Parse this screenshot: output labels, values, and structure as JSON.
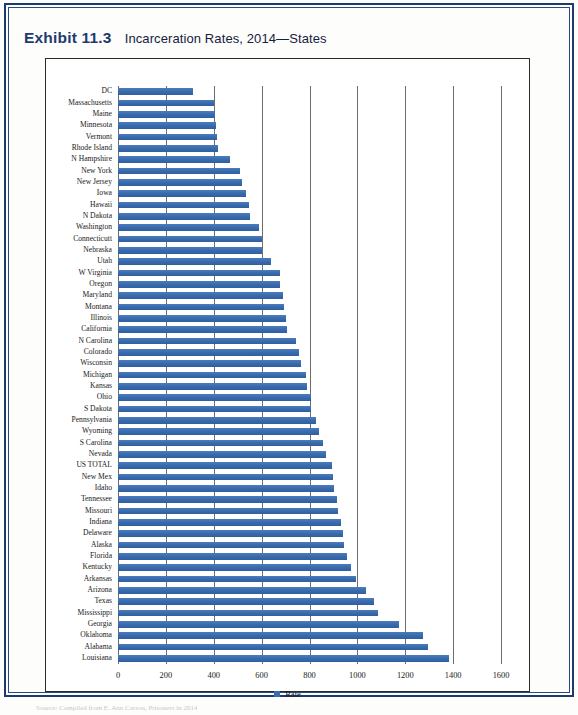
{
  "exhibit": {
    "label": "Exhibit 11.3",
    "title": "Incarceration Rates, 2014—States"
  },
  "source_note": "Source: Compiled from E. Ann Carson, Prisoners in 2014",
  "colors": {
    "bar_blue": "#3a6cae",
    "frame_navy": "#1d3a70",
    "gridline": "#6d6d6d",
    "plot_border": "#2b2b2b"
  },
  "chart_data": {
    "type": "bar",
    "orientation": "horizontal",
    "title": "Incarceration Rates, 2014—States",
    "xlabel": "",
    "ylabel": "",
    "xlim": [
      0,
      1600
    ],
    "xticks": [
      0,
      200,
      400,
      600,
      800,
      1000,
      1200,
      1400,
      1600
    ],
    "grid": true,
    "legend": {
      "position": "bottom",
      "entries": [
        "Rate"
      ]
    },
    "series_name": "Rate",
    "categories": [
      "DC",
      "Massachusetts",
      "Maine",
      "Minnesota",
      "Vermont",
      "Rhode Island",
      "N Hampshire",
      "New York",
      "New Jersey",
      "Iowa",
      "Hawaii",
      "N Dakota",
      "Washington",
      "Connecticutt",
      "Nebraska",
      "Utah",
      "W Virginia",
      "Oregon",
      "Maryland",
      "Montana",
      "Illinois",
      "California",
      "N Carolina",
      "Colorado",
      "Wisconsin",
      "Michigan",
      "Kansas",
      "Ohio",
      "S Dakota",
      "Pennsylvania",
      "Wyoming",
      "S Carolina",
      "Nevada",
      "US TOTAL",
      "New Mex",
      "Idaho",
      "Tennessee",
      "Missouri",
      "Indiana",
      "Delaware",
      "Alaska",
      "Florida",
      "Kentucky",
      "Arkansas",
      "Arizona",
      "Texas",
      "Mississippi",
      "Georgia",
      "Oklahoma",
      "Alabama",
      "Louisiana"
    ],
    "values": [
      312,
      403,
      406,
      411,
      412,
      419,
      469,
      511,
      517,
      534,
      547,
      553,
      589,
      600,
      603,
      639,
      676,
      677,
      689,
      693,
      700,
      707,
      742,
      758,
      766,
      784,
      789,
      805,
      807,
      829,
      838,
      856,
      871,
      893,
      898,
      904,
      913,
      920,
      932,
      938,
      943,
      955,
      974,
      995,
      1037,
      1068,
      1085,
      1174,
      1275,
      1293,
      1383
    ]
  }
}
